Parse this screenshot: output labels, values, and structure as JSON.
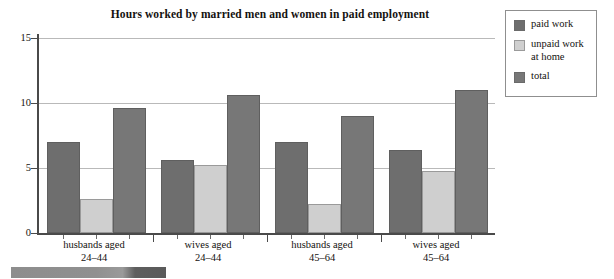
{
  "chart_data": {
    "type": "bar",
    "title": "Hours worked by married men and women in paid employment",
    "xlabel": "",
    "ylabel": "",
    "ylim": [
      0,
      15
    ],
    "yticks": [
      0,
      5,
      10,
      15
    ],
    "ytick_labels": [
      "0",
      "5",
      "10",
      "15"
    ],
    "grid": true,
    "legend_position": "right",
    "categories": [
      "husbands aged 24-44",
      "wives aged 24-44",
      "husbands aged 45-64",
      "wives aged 45-64"
    ],
    "category_lines": [
      {
        "line1": "husbands aged",
        "line2": "24–44"
      },
      {
        "line1": "wives aged",
        "line2": "24–44"
      },
      {
        "line1": "husbands aged",
        "line2": "45–64"
      },
      {
        "line1": "wives aged",
        "line2": "45–64"
      }
    ],
    "series": [
      {
        "name": "paid work",
        "color": "#6e6e6e",
        "values": [
          7.0,
          5.6,
          7.0,
          6.4
        ]
      },
      {
        "name": "unpaid work at home",
        "color": "#cfcfcf",
        "values": [
          2.6,
          5.2,
          2.2,
          4.75
        ]
      },
      {
        "name": "total",
        "color": "#777777",
        "values": [
          9.6,
          10.6,
          9.0,
          11.0
        ]
      }
    ]
  },
  "legend": {
    "items": [
      {
        "label": "paid work",
        "swatch": "paid",
        "color": "#6e6e6e"
      },
      {
        "label": "unpaid work\nat home",
        "label_line1": "unpaid work",
        "label_line2": "at home",
        "swatch": "unpaid",
        "color": "#cfcfcf"
      },
      {
        "label": "total",
        "swatch": "total",
        "color": "#777777"
      }
    ]
  },
  "axis": {
    "y_labels": [
      "15",
      "10",
      "5",
      "0"
    ]
  }
}
